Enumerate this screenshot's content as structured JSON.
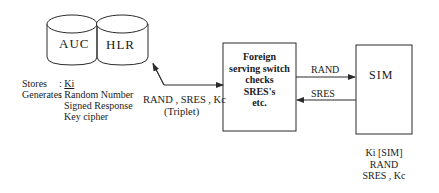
{
  "database": {
    "auc_label": "AUC",
    "hlr_label": "HLR"
  },
  "legend": {
    "stores_label": "Stores",
    "stores_value": "Ki",
    "generates_label": "Generates",
    "generates_items": [
      "Random Number",
      "Signed Response",
      "Key cipher"
    ]
  },
  "triplet_arrow": {
    "line1": "RAND , SRES , Kc",
    "line2": "(Triplet)"
  },
  "foreign_switch": {
    "lines": [
      "Foreign",
      "serving switch",
      "checks",
      "SRES's",
      "etc."
    ]
  },
  "sim_arrows": {
    "to_sim": "RAND",
    "from_sim": "SRES"
  },
  "sim": {
    "label": "SIM",
    "contents": [
      "Ki [SIM]",
      "RAND",
      "SRES , Kc"
    ]
  },
  "colors": {
    "stroke": "#2a2a2a",
    "background": "#ffffff"
  }
}
